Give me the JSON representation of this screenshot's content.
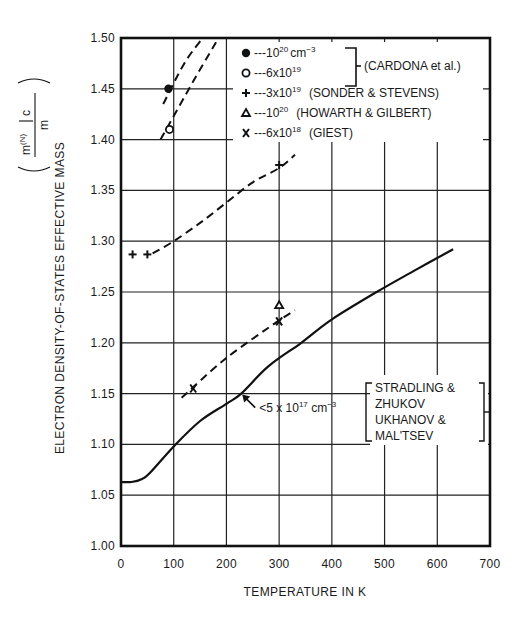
{
  "chart_data": {
    "type": "scatter",
    "title": "",
    "xlabel": "TEMPERATURE IN K",
    "ylabel": "ELECTRON DENSITY-OF-STATES EFFECTIVE MASS",
    "ylabel_formula": {
      "numerator_base": "m",
      "numerator_sup": "(N)",
      "numerator_sub": "c",
      "denominator": "m"
    },
    "xlim": [
      0,
      700
    ],
    "ylim": [
      1.0,
      1.5
    ],
    "grid": true,
    "x_ticks": [
      "0",
      "100",
      "200",
      "300",
      "400",
      "500",
      "600",
      "700"
    ],
    "y_ticks": [
      "1.00",
      "1.05",
      "1.10",
      "1.15",
      "1.20",
      "1.25",
      "1.30",
      "1.35",
      "1.40",
      "1.45",
      "1.50"
    ],
    "series": [
      {
        "name": "10^20 cm^-3 (CARDONA et al.)",
        "marker": "filled-circle",
        "points": [
          {
            "x": 90,
            "y": 1.45
          }
        ],
        "fit_line": {
          "style": "dashed",
          "points": [
            [
              80,
              1.435
            ],
            [
              120,
              1.475
            ],
            [
              155,
              1.5
            ]
          ]
        }
      },
      {
        "name": "6x10^19 (CARDONA et al.)",
        "marker": "open-circle",
        "points": [
          {
            "x": 92,
            "y": 1.41
          }
        ],
        "fit_line": {
          "style": "dashed",
          "points": [
            [
              75,
              1.4
            ],
            [
              140,
              1.46
            ],
            [
              185,
              1.5
            ]
          ]
        }
      },
      {
        "name": "3x10^19 (SONDER & STEVENS)",
        "marker": "plus",
        "points": [
          {
            "x": 22,
            "y": 1.287
          },
          {
            "x": 50,
            "y": 1.287
          },
          {
            "x": 300,
            "y": 1.375
          }
        ],
        "fit_line": {
          "style": "dashed",
          "points": [
            [
              60,
              1.288
            ],
            [
              100,
              1.3
            ],
            [
              150,
              1.318
            ],
            [
              200,
              1.338
            ],
            [
              250,
              1.358
            ],
            [
              300,
              1.372
            ],
            [
              330,
              1.385
            ]
          ]
        }
      },
      {
        "name": "10^20 (HOWARTH & GILBERT)",
        "marker": "triangle",
        "points": [
          {
            "x": 300,
            "y": 1.237
          }
        ]
      },
      {
        "name": "6x10^18 (GIEST)",
        "marker": "x",
        "points": [
          {
            "x": 137,
            "y": 1.155
          },
          {
            "x": 300,
            "y": 1.221
          }
        ],
        "fit_line": {
          "style": "dashed",
          "points": [
            [
              115,
              1.146
            ],
            [
              200,
              1.185
            ],
            [
              300,
              1.222
            ],
            [
              330,
              1.232
            ]
          ]
        }
      },
      {
        "name": "<5 x 10^17 cm^-3 (STRADLING & ZHUKOV, UKHANOV & MAL'TSEV)",
        "marker": "none",
        "line_style": "solid",
        "points": [
          [
            0,
            1.063
          ],
          [
            20,
            1.063
          ],
          [
            40,
            1.066
          ],
          [
            55,
            1.072
          ],
          [
            100,
            1.098
          ],
          [
            150,
            1.123
          ],
          [
            200,
            1.14
          ],
          [
            228,
            1.15
          ],
          [
            280,
            1.177
          ],
          [
            342,
            1.2
          ],
          [
            400,
            1.223
          ],
          [
            485,
            1.25
          ],
          [
            560,
            1.272
          ],
          [
            630,
            1.292
          ]
        ]
      }
    ],
    "legend": [
      {
        "marker": "filled-circle",
        "text": "---10",
        "sup": "20",
        "suffix": "cm",
        "suffix_sup": "−3"
      },
      {
        "marker": "open-circle",
        "text": "---6x10",
        "sup": "19",
        "suffix": "",
        "suffix_sup": ""
      },
      {
        "marker": "plus",
        "text": "---3x10",
        "sup": "19",
        "suffix": "(SONDER & STEVENS)",
        "suffix_sup": ""
      },
      {
        "marker": "triangle",
        "text": "---10",
        "sup": "20",
        "suffix": "(HOWARTH & GILBERT)",
        "suffix_sup": ""
      },
      {
        "marker": "x",
        "text": "---6x10",
        "sup": "18",
        "suffix": "(GIEST)",
        "suffix_sup": ""
      }
    ],
    "legend_group_label": "(CARDONA et al.)",
    "annotations": [
      {
        "text": "<5 x 10",
        "sup": "17",
        "suffix": "cm",
        "suffix_sup": "−3",
        "arrow_to": [
          228,
          1.15
        ]
      },
      {
        "lines": [
          "STRADLING &",
          "ZHUKOV",
          "UKHANOV &",
          "MAL'TSEV"
        ]
      }
    ]
  }
}
